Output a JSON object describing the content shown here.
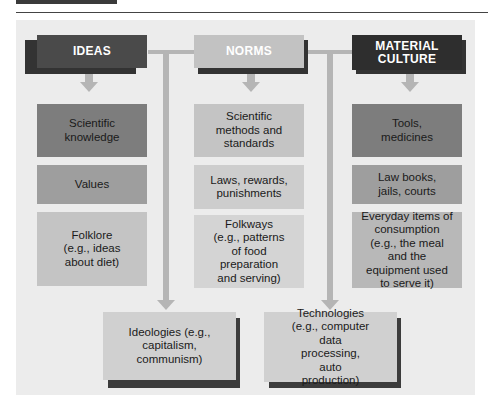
{
  "diagram": {
    "columns": [
      {
        "header": "IDEAS",
        "items": [
          "Scientific knowledge",
          "Values",
          "Folklore (e.g., ideas about diet)"
        ]
      },
      {
        "header": "NORMS",
        "items": [
          "Scientific methods and standards",
          "Laws, rewards, punishments",
          "Folkways (e.g., patterns of food preparation and serving)"
        ]
      },
      {
        "header": "MATERIAL CULTURE",
        "items": [
          "Tools, medicines",
          "Law books, jails, courts",
          "Everyday items of consumption (e.g., the meal and the equipment used to serve it)"
        ]
      }
    ],
    "bottom": [
      {
        "label": "Ideologies (e.g., capitalism, communism)",
        "from": [
          "IDEAS",
          "NORMS"
        ]
      },
      {
        "label": "Technologies (e.g., computer data processing, auto production)",
        "from": [
          "NORMS",
          "MATERIAL CULTURE"
        ]
      }
    ],
    "colors": {
      "ideas_header": "#4a4a4a",
      "norms_header": "#c2c2c2",
      "material_header": "#2e2e2e",
      "row1": "#7d7d7d",
      "row2": "#9e9e9e",
      "row3": "#c4c4c4",
      "panel": "#ececec",
      "connector": "#b5b5b5"
    }
  }
}
